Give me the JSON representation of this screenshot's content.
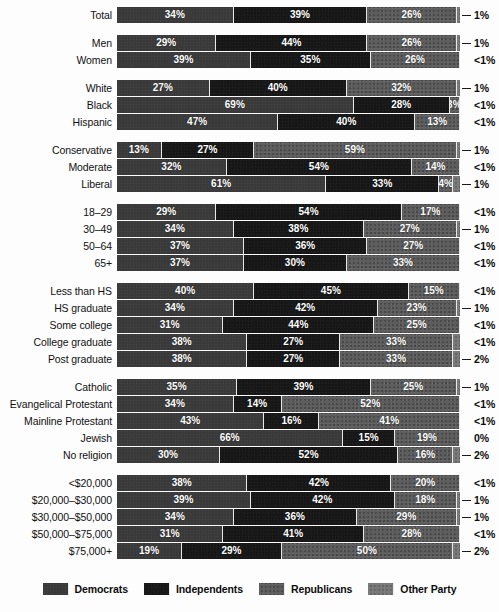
{
  "chart_data": {
    "type": "bar",
    "subtype": "stacked-horizontal-100pct",
    "title": "",
    "xlabel": "",
    "ylabel": "",
    "xlim": [
      0,
      100
    ],
    "grid": false,
    "legend_position": "bottom",
    "legend": [
      "Democrats",
      "Independents",
      "Republicans",
      "Other Party"
    ],
    "series": [
      {
        "name": "Democrats",
        "color": "#3a3a3a",
        "values": [
          34,
          29,
          39,
          27,
          69,
          47,
          13,
          32,
          61,
          29,
          34,
          37,
          37,
          40,
          34,
          31,
          38,
          38,
          35,
          34,
          43,
          66,
          30,
          38,
          39,
          34,
          31,
          19
        ]
      },
      {
        "name": "Independents",
        "color": "#171717",
        "values": [
          39,
          44,
          35,
          40,
          28,
          40,
          27,
          54,
          33,
          54,
          38,
          36,
          30,
          45,
          42,
          44,
          27,
          27,
          39,
          14,
          16,
          15,
          52,
          42,
          42,
          36,
          41,
          29
        ]
      },
      {
        "name": "Republicans",
        "color": "#5d5d5d",
        "values": [
          26,
          26,
          26,
          32,
          3,
          13,
          59,
          14,
          4,
          17,
          27,
          27,
          33,
          15,
          23,
          25,
          33,
          33,
          25,
          52,
          41,
          19,
          16,
          20,
          18,
          29,
          28,
          50
        ]
      },
      {
        "name": "Other Party",
        "color": "#787878",
        "values": [
          1,
          1,
          0.4,
          1,
          0.4,
          0.4,
          1,
          0.4,
          1,
          0.4,
          1,
          0.4,
          0.4,
          0.4,
          1,
          0.4,
          0.4,
          2,
          1,
          0.4,
          0.4,
          0,
          2,
          0.4,
          1,
          1,
          0.4,
          2
        ]
      }
    ],
    "categories": [
      "Total",
      "Men",
      "Women",
      "White",
      "Black",
      "Hispanic",
      "Conservative",
      "Moderate",
      "Liberal",
      "18–29",
      "30–49",
      "50–64",
      "65+",
      "Less than HS",
      "HS graduate",
      "Some college",
      "College graduate",
      "Post graduate",
      "Catholic",
      "Evangelical Protestant",
      "Mainline Protestant",
      "Jewish",
      "No religion",
      "<$20,000",
      "$20,000–$30,000",
      "$30,000–$50,000",
      "$50,000–$75,000",
      "$75,000+"
    ]
  },
  "legend": {
    "items": [
      {
        "label": "Democrats",
        "swatch": "democrats-swatch",
        "class": "dem"
      },
      {
        "label": "Independents",
        "swatch": "independents-swatch",
        "class": "ind"
      },
      {
        "label": "Republicans",
        "swatch": "republicans-swatch",
        "class": "rep"
      },
      {
        "label": "Other Party",
        "swatch": "other-party-swatch",
        "class": "oth"
      }
    ]
  },
  "groups": [
    {
      "name": "total",
      "rows": [
        {
          "label": "Total",
          "dem": "34%",
          "ind": "39%",
          "rep": "26%",
          "oth": "1%",
          "leader": true,
          "w": [
            34,
            39,
            26,
            1
          ]
        }
      ]
    },
    {
      "name": "gender",
      "rows": [
        {
          "label": "Men",
          "dem": "29%",
          "ind": "44%",
          "rep": "26%",
          "oth": "1%",
          "leader": true,
          "w": [
            29,
            44,
            26,
            1
          ]
        },
        {
          "label": "Women",
          "dem": "39%",
          "ind": "35%",
          "rep": "26%",
          "oth": "<1%",
          "leader": false,
          "w": [
            39,
            35,
            26,
            0.4
          ]
        }
      ]
    },
    {
      "name": "race",
      "rows": [
        {
          "label": "White",
          "dem": "27%",
          "ind": "40%",
          "rep": "32%",
          "oth": "1%",
          "leader": true,
          "w": [
            27,
            40,
            32,
            1
          ]
        },
        {
          "label": "Black",
          "dem": "69%",
          "ind": "28%",
          "rep": "3%",
          "oth": "<1%",
          "leader": false,
          "w": [
            69,
            28,
            3,
            0.4
          ]
        },
        {
          "label": "Hispanic",
          "dem": "47%",
          "ind": "40%",
          "rep": "13%",
          "oth": "<1%",
          "leader": false,
          "w": [
            47,
            40,
            13,
            0.4
          ]
        }
      ]
    },
    {
      "name": "ideology",
      "rows": [
        {
          "label": "Conservative",
          "dem": "13%",
          "ind": "27%",
          "rep": "59%",
          "oth": "1%",
          "leader": true,
          "w": [
            13,
            27,
            59,
            1
          ]
        },
        {
          "label": "Moderate",
          "dem": "32%",
          "ind": "54%",
          "rep": "14%",
          "oth": "<1%",
          "leader": false,
          "w": [
            32,
            54,
            14,
            0.4
          ]
        },
        {
          "label": "Liberal",
          "dem": "61%",
          "ind": "33%",
          "rep": "4%",
          "oth": "1%",
          "leader": true,
          "w": [
            61,
            33,
            4,
            1
          ]
        }
      ]
    },
    {
      "name": "age",
      "rows": [
        {
          "label": "18–29",
          "dem": "29%",
          "ind": "54%",
          "rep": "17%",
          "oth": "<1%",
          "leader": false,
          "w": [
            29,
            54,
            17,
            0.4
          ]
        },
        {
          "label": "30–49",
          "dem": "34%",
          "ind": "38%",
          "rep": "27%",
          "oth": "1%",
          "leader": true,
          "w": [
            34,
            38,
            27,
            1
          ]
        },
        {
          "label": "50–64",
          "dem": "37%",
          "ind": "36%",
          "rep": "27%",
          "oth": "<1%",
          "leader": false,
          "w": [
            37,
            36,
            27,
            0.4
          ]
        },
        {
          "label": "65+",
          "dem": "37%",
          "ind": "30%",
          "rep": "33%",
          "oth": "<1%",
          "leader": false,
          "w": [
            37,
            30,
            33,
            0.4
          ]
        }
      ]
    },
    {
      "name": "education",
      "rows": [
        {
          "label": "Less than HS",
          "dem": "40%",
          "ind": "45%",
          "rep": "15%",
          "oth": "<1%",
          "leader": false,
          "w": [
            40,
            45,
            15,
            0.4
          ]
        },
        {
          "label": "HS graduate",
          "dem": "34%",
          "ind": "42%",
          "rep": "23%",
          "oth": "1%",
          "leader": true,
          "w": [
            34,
            42,
            23,
            1
          ]
        },
        {
          "label": "Some college",
          "dem": "31%",
          "ind": "44%",
          "rep": "25%",
          "oth": "<1%",
          "leader": false,
          "w": [
            31,
            44,
            25,
            0.4
          ]
        },
        {
          "label": "College graduate",
          "dem": "38%",
          "ind": "27%",
          "rep": "33%",
          "oth": "<1%",
          "leader": false,
          "w": [
            38,
            27,
            33,
            0.4
          ]
        },
        {
          "label": "Post graduate",
          "dem": "38%",
          "ind": "27%",
          "rep": "33%",
          "oth": "2%",
          "leader": true,
          "w": [
            38,
            27,
            33,
            2
          ]
        }
      ]
    },
    {
      "name": "religion",
      "rows": [
        {
          "label": "Catholic",
          "dem": "35%",
          "ind": "39%",
          "rep": "25%",
          "oth": "1%",
          "leader": true,
          "w": [
            35,
            39,
            25,
            1
          ]
        },
        {
          "label": "Evangelical Protestant",
          "dem": "34%",
          "ind": "14%",
          "rep": "52%",
          "oth": "<1%",
          "leader": false,
          "w": [
            34,
            14,
            52,
            0.4
          ]
        },
        {
          "label": "Mainline Protestant",
          "dem": "43%",
          "ind": "16%",
          "rep": "41%",
          "oth": "<1%",
          "leader": false,
          "w": [
            43,
            16,
            41,
            0.4
          ]
        },
        {
          "label": "Jewish",
          "dem": "66%",
          "ind": "15%",
          "rep": "19%",
          "oth": "0%",
          "leader": false,
          "w": [
            66,
            15,
            19,
            0
          ]
        },
        {
          "label": "No religion",
          "dem": "30%",
          "ind": "52%",
          "rep": "16%",
          "oth": "2%",
          "leader": true,
          "w": [
            30,
            52,
            16,
            2
          ]
        }
      ]
    },
    {
      "name": "income",
      "rows": [
        {
          "label": "<$20,000",
          "dem": "38%",
          "ind": "42%",
          "rep": "20%",
          "oth": "<1%",
          "leader": false,
          "w": [
            38,
            42,
            20,
            0.4
          ]
        },
        {
          "label": "$20,000–$30,000",
          "dem": "39%",
          "ind": "42%",
          "rep": "18%",
          "oth": "1%",
          "leader": true,
          "w": [
            39,
            42,
            18,
            1
          ]
        },
        {
          "label": "$30,000–$50,000",
          "dem": "34%",
          "ind": "36%",
          "rep": "29%",
          "oth": "1%",
          "leader": true,
          "w": [
            34,
            36,
            29,
            1
          ]
        },
        {
          "label": "$50,000–$75,000",
          "dem": "31%",
          "ind": "41%",
          "rep": "28%",
          "oth": "<1%",
          "leader": false,
          "w": [
            31,
            41,
            28,
            0.4
          ]
        },
        {
          "label": "$75,000+",
          "dem": "19%",
          "ind": "29%",
          "rep": "50%",
          "oth": "2%",
          "leader": true,
          "w": [
            19,
            29,
            50,
            2
          ]
        }
      ]
    }
  ]
}
